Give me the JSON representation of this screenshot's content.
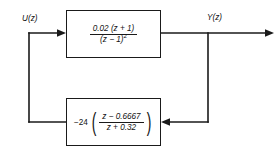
{
  "diagram": {
    "type": "control-system-block-diagram",
    "line_color": "#1a1a1a",
    "background_color": "#ffffff",
    "signals": {
      "input_label": "U(z)",
      "output_label": "Y(z)"
    },
    "forward_block": {
      "name": "plant",
      "numerator": "0.02 (z + 1)",
      "denominator": "(z − 1)",
      "denominator_exponent": "2",
      "expression": "0.02 (z + 1) / (z − 1)^2"
    },
    "feedback_block": {
      "name": "compensator",
      "gain": "−24",
      "numerator": "z − 0.6667",
      "denominator": "z + 0.32",
      "left_paren": "(",
      "right_paren": ")",
      "expression": "−24 ( (z − 0.6667) / (z + 0.32) )"
    }
  }
}
